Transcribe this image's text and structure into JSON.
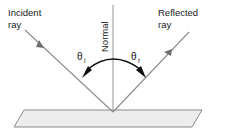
{
  "diagram": {
    "labels": {
      "incident_line1": "Incident",
      "incident_line2": "ray",
      "reflected_line1": "Reflected",
      "reflected_line2": "ray",
      "normal": "Normal"
    },
    "angles": {
      "incident_symbol": "θ",
      "incident_subscript": "i",
      "reflected_symbol": "θ",
      "reflected_subscript": "r"
    },
    "colors": {
      "background": "#ffffff",
      "ray_stroke": "#8c8c8c",
      "normal_stroke": "#a8a8a8",
      "arc_stroke": "#0e0e0e",
      "surface_fill": "#ededed",
      "surface_stroke": "#8a8a8a",
      "text": "#1a1a1a"
    },
    "geometry": {
      "vertex_x": 113,
      "vertex_y": 112,
      "incident_start_x": 25,
      "incident_start_y": 30,
      "reflected_end_x": 189,
      "reflected_end_y": 32,
      "normal_top_y": 5,
      "surface_top_left_x": 24,
      "surface_top_right_x": 202,
      "surface_top_y": 110,
      "surface_bottom_left_x": 14,
      "surface_bottom_right_x": 192,
      "surface_bottom_y": 127
    }
  }
}
